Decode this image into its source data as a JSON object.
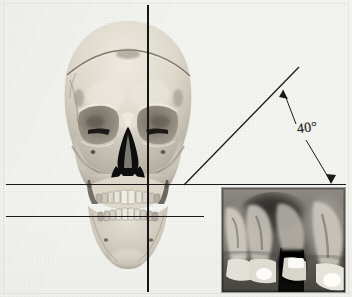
{
  "figure": {
    "title": "Frontal skull photograph with cephalometric reference lines and inset periapical radiograph",
    "background_color": "#f3f3f0",
    "line_color": "#1a1a1a"
  },
  "annotations": {
    "angle_label": "40°",
    "angle_value": 40,
    "angle_unit": "degrees"
  },
  "reference_lines": [
    {
      "name": "horizontal-upper-plane",
      "orientation": "horizontal",
      "y": 184
    },
    {
      "name": "horizontal-lower-plane",
      "orientation": "horizontal",
      "y": 216
    },
    {
      "name": "vertical-midline",
      "orientation": "vertical",
      "x": 148
    },
    {
      "name": "oblique-ray",
      "orientation": "oblique",
      "from_x": 184,
      "from_y": 184,
      "to_x": 298,
      "to_y": 68
    }
  ],
  "leaders": [
    {
      "name": "leader-to-oblique-ray",
      "arrow": "up-left"
    },
    {
      "name": "leader-to-horizontal-plane",
      "arrow": "down"
    }
  ],
  "skull": {
    "name": "anterior-skull-photograph",
    "view": "frontal",
    "features": [
      "cranial-vault",
      "coronal-suture-line",
      "orbits",
      "nasal-aperture",
      "maxilla",
      "mandible",
      "dentition"
    ]
  },
  "radiograph": {
    "name": "periapical-radiograph-inset",
    "type": "dental periapical radiograph",
    "region": "maxillary posterior teeth",
    "features": [
      "tooth-roots",
      "radiopaque-restorations",
      "alveolar-bone",
      "maxillary-sinus"
    ]
  },
  "colors": {
    "plate": "#f3f3f0",
    "ink": "#1a1a1a",
    "bone_light": "#e6e2d8",
    "bone_mid": "#c9c3b5",
    "bone_shadow": "#8e887c",
    "cavity_dark": "#141414",
    "xray_dark": "#1b1b1b",
    "xray_light": "#e9e6df"
  }
}
